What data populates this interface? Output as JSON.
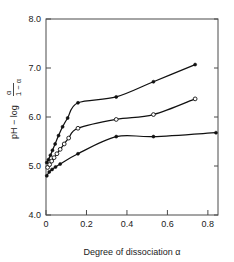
{
  "chart_data": {
    "type": "line",
    "title": "",
    "subtitle": "",
    "xlabel": "Degree of dissociation α",
    "ylabel": "pH − log α/(1−α)",
    "ylabel_parts": {
      "main": "pH − log",
      "numerator": "α",
      "denominator": "1 − α"
    },
    "xlim": [
      0.0,
      0.85
    ],
    "ylim": [
      4.0,
      8.0
    ],
    "grid": false,
    "legend": "none",
    "xticks": [
      0,
      0.2,
      0.4,
      0.6,
      0.8
    ],
    "xtick_labels": [
      "0",
      "0.2",
      "0.4",
      "0.6",
      "0.8"
    ],
    "yticks": [
      4.0,
      5.0,
      6.0,
      7.0,
      8.0
    ],
    "ytick_labels": [
      "4.0",
      "5.0",
      "6.0",
      "7.0",
      "8.0"
    ],
    "series": [
      {
        "name": "upper curve",
        "marker": "filled-circle",
        "x": [
          0.004,
          0.012,
          0.022,
          0.032,
          0.045,
          0.062,
          0.082,
          0.107,
          0.158,
          0.347,
          0.531,
          0.737
        ],
        "y": [
          5.07,
          5.13,
          5.22,
          5.32,
          5.45,
          5.62,
          5.8,
          5.98,
          6.29,
          6.41,
          6.72,
          7.07
        ]
      },
      {
        "name": "middle curve",
        "marker": "open-circle",
        "x": [
          0.008,
          0.018,
          0.028,
          0.04,
          0.054,
          0.07,
          0.09,
          0.112,
          0.158,
          0.347,
          0.531,
          0.737
        ],
        "y": [
          4.97,
          5.03,
          5.1,
          5.17,
          5.25,
          5.34,
          5.45,
          5.57,
          5.77,
          5.95,
          6.05,
          6.37
        ]
      },
      {
        "name": "lower curve",
        "marker": "filled-circle",
        "x": [
          0.004,
          0.016,
          0.03,
          0.047,
          0.07,
          0.158,
          0.347,
          0.531,
          0.84
        ],
        "y": [
          4.8,
          4.88,
          4.93,
          4.98,
          5.04,
          5.25,
          5.6,
          5.6,
          5.68
        ]
      }
    ]
  },
  "axes": {
    "x_axis_name": "x-axis",
    "y_axis_name": "y-axis"
  }
}
